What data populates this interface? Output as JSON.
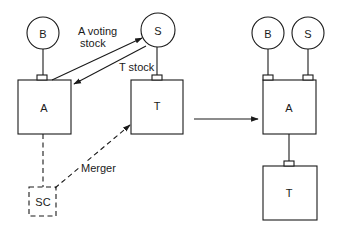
{
  "diagram": {
    "type": "reverse-triangular-merger",
    "colors": {
      "stroke": "#1a1a1a",
      "background": "#ffffff"
    },
    "before": {
      "nodes": {
        "B": {
          "label": "B",
          "shape": "circle"
        },
        "S": {
          "label": "S",
          "shape": "circle"
        },
        "A": {
          "label": "A",
          "shape": "box"
        },
        "T": {
          "label": "T",
          "shape": "box"
        },
        "SC": {
          "label": "SC",
          "shape": "dashed-box"
        }
      },
      "edges": [
        {
          "from": "A",
          "to": "S",
          "label": "A voting stock",
          "label_lines": [
            "A voting",
            "stock"
          ],
          "style": "solid-arrow"
        },
        {
          "from": "S",
          "to": "A",
          "label": "T stock",
          "style": "solid-arrow"
        },
        {
          "from": "SC",
          "to": "T",
          "label": "Merger",
          "style": "dashed-arrow"
        },
        {
          "from": "A",
          "to": "SC",
          "style": "dashed-line"
        },
        {
          "from": "B",
          "to": "A",
          "style": "ownership-line"
        },
        {
          "from": "S",
          "to": "T",
          "style": "ownership-line"
        }
      ]
    },
    "transition_arrow": {
      "direction": "right"
    },
    "after": {
      "nodes": {
        "B": {
          "label": "B",
          "shape": "circle"
        },
        "S": {
          "label": "S",
          "shape": "circle"
        },
        "A": {
          "label": "A",
          "shape": "box"
        },
        "T": {
          "label": "T",
          "shape": "box"
        }
      },
      "edges": [
        {
          "from": "B",
          "to": "A",
          "style": "ownership-line"
        },
        {
          "from": "S",
          "to": "A",
          "style": "ownership-line"
        },
        {
          "from": "A",
          "to": "T",
          "style": "ownership-line"
        }
      ]
    }
  }
}
